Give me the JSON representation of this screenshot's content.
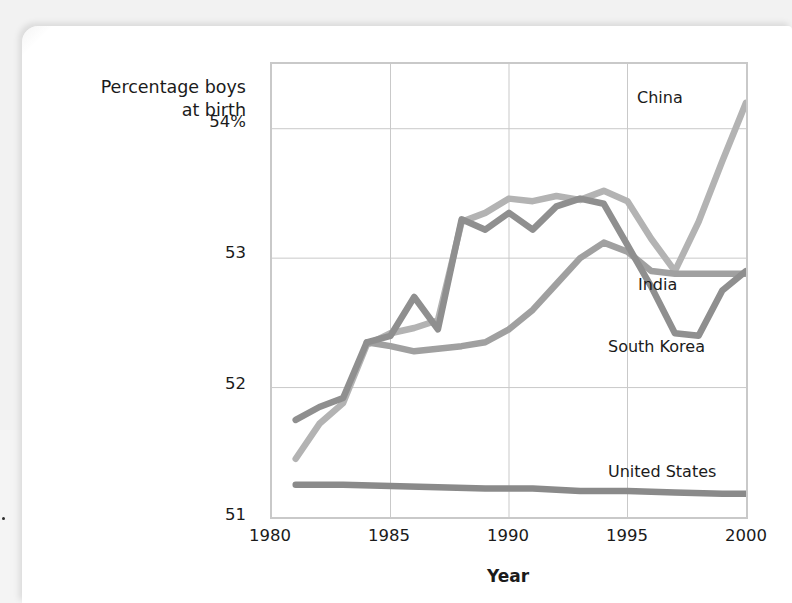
{
  "axis_title": {
    "line1": "Percentage boys",
    "line2": "at birth"
  },
  "chart_data": {
    "type": "line",
    "title": "",
    "subtitle": "",
    "xlabel": "Year",
    "ylabel": "Percentage boys at birth",
    "xlim": [
      1980,
      2000
    ],
    "ylim": [
      51,
      54.5
    ],
    "grid": true,
    "legend_position": "inline-right-of-series",
    "x_ticks": [
      "1980",
      "1985",
      "1990",
      "1995",
      "2000"
    ],
    "x_tick_values": [
      1980,
      1985,
      1990,
      1995,
      2000
    ],
    "y_ticks": [
      "51",
      "52",
      "53",
      "54%"
    ],
    "y_tick_values": [
      51,
      52,
      53,
      54
    ],
    "colors": {
      "china": "#b3b3b3",
      "india": "#a0a0a0",
      "south_korea": "#8f8f8f",
      "united_states": "#8a8a8a"
    },
    "series": [
      {
        "name": "China",
        "color": "#b3b3b3",
        "x": [
          1981,
          1982,
          1983,
          1984,
          1985,
          1986,
          1987,
          1988,
          1989,
          1990,
          1991,
          1992,
          1993,
          1994,
          1995,
          1996,
          1997,
          1998,
          1999,
          2000
        ],
        "values": [
          51.45,
          51.72,
          51.88,
          52.33,
          52.42,
          52.46,
          52.52,
          53.28,
          53.35,
          53.46,
          53.44,
          53.48,
          53.45,
          53.52,
          53.44,
          53.15,
          52.9,
          53.28,
          53.75,
          54.2
        ]
      },
      {
        "name": "South Korea",
        "color": "#8f8f8f",
        "x": [
          1981,
          1982,
          1983,
          1984,
          1985,
          1986,
          1987,
          1988,
          1989,
          1990,
          1991,
          1992,
          1993,
          1994,
          1995,
          1996,
          1997,
          1998,
          1999,
          2000
        ],
        "values": [
          51.75,
          51.85,
          51.92,
          52.35,
          52.4,
          52.7,
          52.45,
          53.3,
          53.22,
          53.35,
          53.22,
          53.4,
          53.46,
          53.42,
          53.1,
          52.78,
          52.42,
          52.4,
          52.75,
          52.9
        ]
      },
      {
        "name": "India",
        "color": "#a0a0a0",
        "x": [
          1984,
          1985,
          1986,
          1987,
          1988,
          1989,
          1990,
          1991,
          1992,
          1993,
          1994,
          1995,
          1996,
          1997,
          1998,
          1999,
          2000
        ],
        "values": [
          52.35,
          52.32,
          52.28,
          52.3,
          52.32,
          52.35,
          52.45,
          52.6,
          52.8,
          53.0,
          53.12,
          53.05,
          52.9,
          52.88,
          52.88,
          52.88,
          52.88
        ]
      },
      {
        "name": "United States",
        "color": "#8a8a8a",
        "x": [
          1981,
          1983,
          1985,
          1987,
          1989,
          1991,
          1993,
          1995,
          1997,
          1999,
          2000
        ],
        "values": [
          51.25,
          51.25,
          51.24,
          51.23,
          51.22,
          51.22,
          51.2,
          51.2,
          51.19,
          51.18,
          51.18
        ]
      }
    ],
    "series_labels": [
      {
        "name": "China",
        "text": "China"
      },
      {
        "name": "India",
        "text": "India"
      },
      {
        "name": "South Korea",
        "text": "South Korea"
      },
      {
        "name": "United States",
        "text": "United States"
      }
    ]
  }
}
